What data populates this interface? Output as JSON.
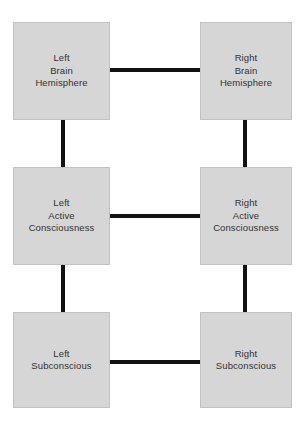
{
  "diagram": {
    "type": "node-link-diagram",
    "canvas": {
      "width": 307,
      "height": 425,
      "background_color": "#ffffff"
    },
    "style": {
      "node_fill_color": "#d6d6d6",
      "node_border_color": "#c2c2c2",
      "connector_color": "#121212",
      "text_color": "#333333"
    },
    "nodes": [
      {
        "id": "left-brain-hemisphere",
        "label": "Left\nBrain\nHemisphere",
        "column": "left",
        "row": "top"
      },
      {
        "id": "right-brain-hemisphere",
        "label": "Right\nBrain\nHemisphere",
        "column": "right",
        "row": "top"
      },
      {
        "id": "left-active-consciousness",
        "label": "Left\nActive\nConsciousness",
        "column": "left",
        "row": "middle"
      },
      {
        "id": "right-active-consciousness",
        "label": "Right\nActive\nConsciousness",
        "column": "right",
        "row": "middle"
      },
      {
        "id": "left-subconscious",
        "label": "Left\nSubconscious",
        "column": "left",
        "row": "bottom"
      },
      {
        "id": "right-subconscious",
        "label": "Right\nSubconscious",
        "column": "right",
        "row": "bottom"
      }
    ],
    "connectors": [
      {
        "id": "brain-hemispheres-link",
        "from": "left-brain-hemisphere",
        "to": "right-brain-hemisphere",
        "orientation": "horizontal"
      },
      {
        "id": "active-consciousness-link",
        "from": "left-active-consciousness",
        "to": "right-active-consciousness",
        "orientation": "horizontal"
      },
      {
        "id": "subconscious-link",
        "from": "left-subconscious",
        "to": "right-subconscious",
        "orientation": "horizontal"
      },
      {
        "id": "left-brain-to-active-link",
        "from": "left-brain-hemisphere",
        "to": "left-active-consciousness",
        "orientation": "vertical"
      },
      {
        "id": "left-active-to-subconscious-link",
        "from": "left-active-consciousness",
        "to": "left-subconscious",
        "orientation": "vertical"
      },
      {
        "id": "right-brain-to-active-link",
        "from": "right-brain-hemisphere",
        "to": "right-active-consciousness",
        "orientation": "vertical"
      },
      {
        "id": "right-active-to-subconscious-link",
        "from": "right-active-consciousness",
        "to": "right-subconscious",
        "orientation": "vertical"
      }
    ]
  }
}
